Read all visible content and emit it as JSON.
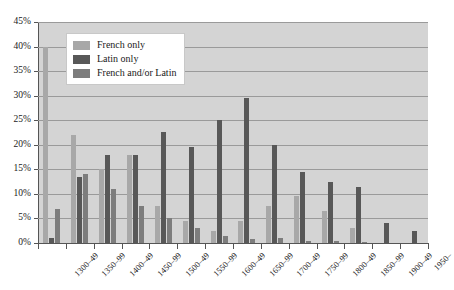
{
  "chart_data": {
    "type": "bar",
    "title": "",
    "subtitle": "",
    "xlabel": "",
    "ylabel": "",
    "ylim": [
      0,
      45
    ],
    "ytick_values": [
      0,
      5,
      10,
      15,
      20,
      25,
      30,
      35,
      40,
      45
    ],
    "ytick_labels": [
      "0%",
      "5%",
      "10%",
      "15%",
      "20%",
      "25%",
      "30%",
      "35%",
      "40%",
      "45%"
    ],
    "grid": true,
    "legend_position": "top-left-inside",
    "categories": [
      "1300–49",
      "1350–99",
      "1400–49",
      "1450–99",
      "1500–49",
      "1550–99",
      "1600–49",
      "1650–99",
      "1700–49",
      "1750–99",
      "1800–49",
      "1850–99",
      "1900–49",
      "1950–"
    ],
    "series": [
      {
        "name": "French only",
        "color": "#a8a8a8",
        "values": [
          40.0,
          22.0,
          15.0,
          18.0,
          7.5,
          4.5,
          2.5,
          4.5,
          7.5,
          9.5,
          6.5,
          3.0,
          0.0,
          0.0
        ]
      },
      {
        "name": "Latin only",
        "color": "#585858",
        "values": [
          1.0,
          13.5,
          18.0,
          18.0,
          22.5,
          19.5,
          25.0,
          29.5,
          20.0,
          14.5,
          12.5,
          11.5,
          4.0,
          2.5
        ]
      },
      {
        "name": "French and/or Latin",
        "color": "#7d7d7d",
        "values": [
          7.0,
          14.0,
          11.0,
          7.5,
          5.0,
          3.0,
          1.5,
          0.8,
          1.0,
          0.5,
          0.5,
          0.3,
          0.0,
          0.0
        ]
      }
    ]
  }
}
